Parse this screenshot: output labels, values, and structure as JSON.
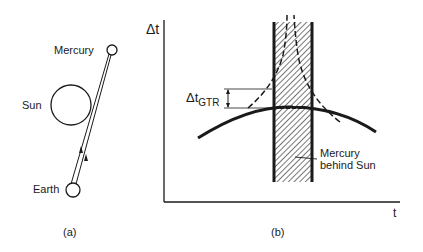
{
  "panel_a": {
    "caption": "(a)",
    "labels": {
      "mercury": "Mercury",
      "sun": "Sun",
      "earth": "Earth"
    }
  },
  "panel_b": {
    "caption": "(b)",
    "y_axis_label": "Δt",
    "x_axis_label": "t",
    "delta_label_main": "Δt",
    "delta_label_sub": "GTR",
    "annotation_line1": "Mercury",
    "annotation_line2": "behind Sun"
  },
  "colors": {
    "ink": "#1a1a1a",
    "background": "#ffffff"
  }
}
